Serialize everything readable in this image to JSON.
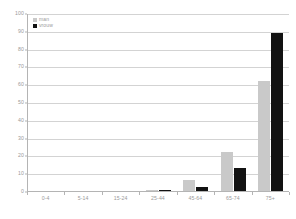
{
  "chart_data": {
    "type": "bar",
    "title": "",
    "subtitle": "",
    "xlabel": "",
    "ylabel": "",
    "categories": [
      "0-4",
      "5-14",
      "15-24",
      "25-44",
      "45-64",
      "65-74",
      "75+"
    ],
    "series": [
      {
        "name": "man",
        "color": "#c9c9c9",
        "values": [
          0,
          0,
          0,
          0.6,
          6,
          22,
          62
        ]
      },
      {
        "name": "vrouw",
        "color": "#121212",
        "values": [
          0,
          0,
          0,
          0.2,
          2,
          13,
          89
        ]
      }
    ],
    "ylim": [
      0,
      100
    ],
    "ytick_step": 10,
    "yticks": [
      "0",
      "10",
      "20",
      "30",
      "40",
      "50",
      "60",
      "70",
      "80",
      "90",
      "100"
    ],
    "grid": true,
    "legend_position": "top-left"
  },
  "colors": {
    "series_man": "#c9c9c9",
    "series_vrouw": "#121212",
    "gridline": "#d3d3d3",
    "axis": "#b4b4b4",
    "text": "#9a9a9a",
    "background": "#ffffff"
  }
}
